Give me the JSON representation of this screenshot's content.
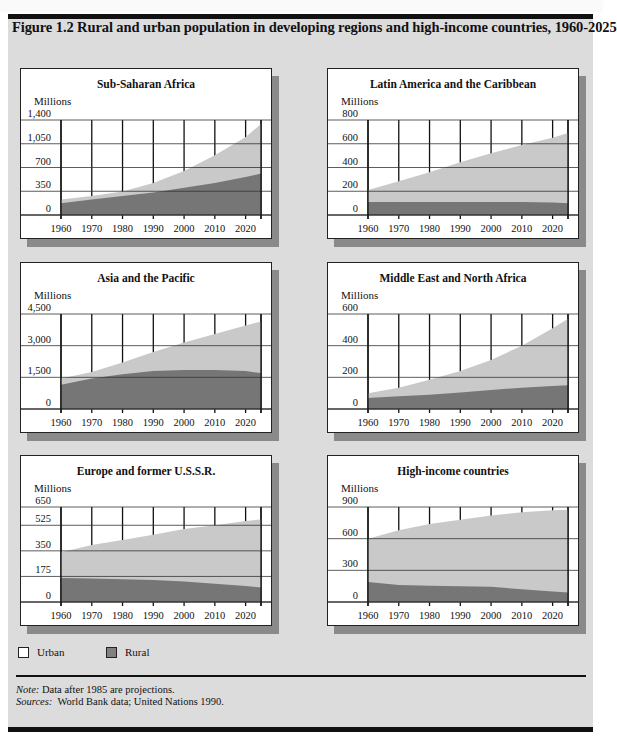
{
  "figure": {
    "title": "Figure 1.2  Rural and urban population in developing regions and high-income countries, 1960-2025",
    "y_unit_label": "Millions"
  },
  "legend": {
    "items": [
      {
        "label": "Urban",
        "color": "#ffffff"
      },
      {
        "label": "Rural",
        "color": "#808080"
      }
    ]
  },
  "colors": {
    "urban_fill": "#c9c9c9",
    "rural_fill": "#767676",
    "panel_bg": "#ffffff",
    "figure_bg": "#dcdcdc",
    "shadow": "#8a8a8a"
  },
  "footer": {
    "note_label": "Note:",
    "note_text": " Data after 1985 are projections.",
    "sources_label": "Sources:",
    "sources_text": "  World Bank data; United Nations 1990."
  },
  "chart_data": [
    {
      "type": "area",
      "stacked": true,
      "title": "Sub-Saharan Africa",
      "ylabel": "Millions",
      "x": [
        1960,
        1970,
        1980,
        1990,
        2000,
        2010,
        2020,
        2025
      ],
      "xticks": [
        "1960",
        "1970",
        "1980",
        "1990",
        "2000",
        "2010",
        "2020"
      ],
      "yticks": [
        0,
        350,
        700,
        1050,
        1400
      ],
      "ytick_labels": [
        "0",
        "350",
        "700",
        "1,050",
        "1,400"
      ],
      "ylim": [
        0,
        1400
      ],
      "grid": true,
      "series": [
        {
          "name": "Rural",
          "values": [
            175,
            230,
            280,
            330,
            400,
            470,
            560,
            610
          ]
        },
        {
          "name": "Urban",
          "values": [
            55,
            50,
            65,
            140,
            250,
            410,
            590,
            730
          ]
        }
      ],
      "total": [
        230,
        280,
        345,
        470,
        650,
        880,
        1150,
        1340
      ]
    },
    {
      "type": "area",
      "stacked": true,
      "title": "Latin America and the Caribbean",
      "ylabel": "Millions",
      "x": [
        1960,
        1970,
        1980,
        1990,
        2000,
        2010,
        2020,
        2025
      ],
      "xticks": [
        "1960",
        "1970",
        "1980",
        "1990",
        "2000",
        "2010",
        "2020"
      ],
      "yticks": [
        0,
        200,
        400,
        600,
        800
      ],
      "ytick_labels": [
        "0",
        "200",
        "400",
        "600",
        "800"
      ],
      "ylim": [
        0,
        800
      ],
      "grid": true,
      "series": [
        {
          "name": "Rural",
          "values": [
            110,
            110,
            110,
            110,
            110,
            110,
            105,
            100
          ]
        },
        {
          "name": "Urban",
          "values": [
            100,
            175,
            250,
            335,
            410,
            480,
            545,
            590
          ]
        }
      ],
      "total": [
        210,
        285,
        360,
        445,
        520,
        590,
        650,
        690
      ]
    },
    {
      "type": "area",
      "stacked": true,
      "title": "Asia and the Pacific",
      "ylabel": "Millions",
      "x": [
        1960,
        1970,
        1980,
        1990,
        2000,
        2010,
        2020,
        2025
      ],
      "xticks": [
        "1960",
        "1970",
        "1980",
        "1990",
        "2000",
        "2010",
        "2020"
      ],
      "yticks": [
        0,
        1500,
        3000,
        4500
      ],
      "ytick_labels": [
        "0",
        "1,500",
        "3,000",
        "4,500"
      ],
      "ylim": [
        0,
        4500
      ],
      "grid": true,
      "series": [
        {
          "name": "Rural",
          "values": [
            1150,
            1450,
            1650,
            1800,
            1850,
            1850,
            1800,
            1700
          ]
        },
        {
          "name": "Urban",
          "values": [
            300,
            300,
            550,
            900,
            1300,
            1700,
            2150,
            2450
          ]
        }
      ],
      "total": [
        1450,
        1750,
        2200,
        2700,
        3150,
        3550,
        3950,
        4150
      ]
    },
    {
      "type": "area",
      "stacked": true,
      "title": "Middle East and North Africa",
      "ylabel": "Millions",
      "x": [
        1960,
        1970,
        1980,
        1990,
        2000,
        2010,
        2020,
        2025
      ],
      "xticks": [
        "1960",
        "1970",
        "1980",
        "1990",
        "2000",
        "2010",
        "2020"
      ],
      "yticks": [
        0,
        200,
        400,
        600
      ],
      "ytick_labels": [
        "0",
        "200",
        "400",
        "600"
      ],
      "ylim": [
        0,
        600
      ],
      "grid": true,
      "series": [
        {
          "name": "Rural",
          "values": [
            70,
            80,
            90,
            105,
            120,
            135,
            145,
            150
          ]
        },
        {
          "name": "Urban",
          "values": [
            30,
            55,
            95,
            135,
            190,
            265,
            365,
            420
          ]
        }
      ],
      "total": [
        100,
        135,
        185,
        240,
        310,
        400,
        510,
        570
      ]
    },
    {
      "type": "area",
      "stacked": true,
      "title": "Europe and former U.S.S.R.",
      "ylabel": "Millions",
      "x": [
        1960,
        1970,
        1980,
        1990,
        2000,
        2010,
        2020,
        2025
      ],
      "xticks": [
        "1960",
        "1970",
        "1980",
        "1990",
        "2000",
        "2010",
        "2020"
      ],
      "yticks": [
        0,
        175,
        350,
        525,
        650
      ],
      "ytick_labels": [
        "0",
        "175",
        "350",
        "525",
        "650"
      ],
      "ylim": [
        0,
        650
      ],
      "grid": true,
      "series": [
        {
          "name": "Rural",
          "values": [
            165,
            160,
            155,
            150,
            140,
            125,
            110,
            100
          ]
        },
        {
          "name": "Urban",
          "values": [
            175,
            230,
            270,
            310,
            360,
            400,
            445,
            465
          ]
        }
      ],
      "total": [
        340,
        390,
        425,
        460,
        500,
        525,
        555,
        565
      ]
    },
    {
      "type": "area",
      "stacked": true,
      "title": "High-income countries",
      "ylabel": "Millions",
      "x": [
        1960,
        1970,
        1980,
        1990,
        2000,
        2010,
        2020,
        2025
      ],
      "xticks": [
        "1960",
        "1970",
        "1980",
        "1990",
        "2000",
        "2010",
        "2020"
      ],
      "yticks": [
        0,
        300,
        600,
        900
      ],
      "ytick_labels": [
        "0",
        "300",
        "600",
        "900"
      ],
      "ylim": [
        0,
        900
      ],
      "grid": true,
      "series": [
        {
          "name": "Rural",
          "values": [
            190,
            160,
            155,
            150,
            145,
            120,
            100,
            90
          ]
        },
        {
          "name": "Urban",
          "values": [
            410,
            520,
            585,
            630,
            675,
            730,
            770,
            785
          ]
        }
      ],
      "total": [
        600,
        680,
        740,
        780,
        820,
        850,
        870,
        875
      ]
    }
  ]
}
